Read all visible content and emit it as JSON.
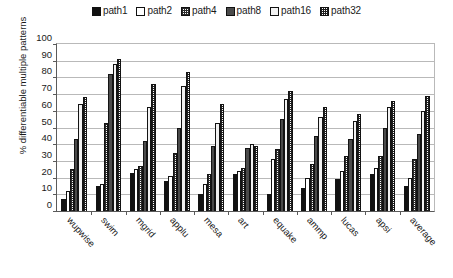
{
  "chart_data": {
    "type": "bar",
    "title": "",
    "xlabel": "",
    "ylabel": "% differentiable multiple patterns",
    "ylim": [
      0,
      100
    ],
    "ytick_labels": [
      "100",
      "90",
      "80",
      "70",
      "60",
      "50",
      "40",
      "30",
      "20",
      "10",
      "0"
    ],
    "ytick_values": [
      100,
      90,
      80,
      70,
      60,
      50,
      40,
      30,
      20,
      10,
      0
    ],
    "grid": true,
    "legend_position": "top-center",
    "categories": [
      "wupwise",
      "swim",
      "mgrid",
      "applu",
      "mesa",
      "art",
      "equake",
      "ammp",
      "lucas",
      "apsi",
      "average"
    ],
    "series": [
      {
        "name": "path1",
        "swatch": "solid-black",
        "values": [
          7,
          15,
          23,
          18,
          10,
          22,
          10,
          14,
          19,
          22,
          15
        ]
      },
      {
        "name": "path2",
        "swatch": "white",
        "values": [
          12,
          16,
          25,
          21,
          16,
          24,
          31,
          20,
          24,
          26,
          20
        ]
      },
      {
        "name": "path4",
        "swatch": "fine-checker",
        "values": [
          25,
          53,
          27,
          35,
          22,
          26,
          37,
          28,
          33,
          33,
          31
        ]
      },
      {
        "name": "path8",
        "swatch": "solid-gray",
        "values": [
          43,
          82,
          42,
          50,
          39,
          38,
          55,
          45,
          43,
          50,
          46
        ]
      },
      {
        "name": "path16",
        "swatch": "light",
        "values": [
          64,
          88,
          62,
          75,
          53,
          40,
          67,
          56,
          54,
          62,
          60
        ]
      },
      {
        "name": "path32",
        "swatch": "coarse-checker",
        "values": [
          68,
          91,
          76,
          83,
          64,
          39,
          72,
          62,
          58,
          66,
          69
        ]
      }
    ]
  }
}
